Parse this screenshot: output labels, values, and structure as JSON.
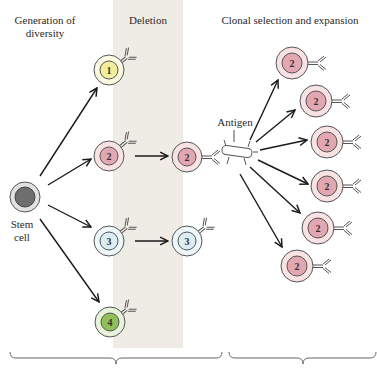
{
  "headings": {
    "generation": "Generation of diversity",
    "generation_line1": "Generation of",
    "generation_line2": "diversity",
    "deletion": "Deletion",
    "clonal": "Clonal selection and expansion"
  },
  "labels": {
    "stem_line1": "Stem",
    "stem_line2": "cell",
    "antigen": "Antigen"
  },
  "cells": {
    "stem": {
      "label": "",
      "nucleus_color": "#6e6e6e",
      "cyto_color": "#e2e2e2"
    },
    "c1": {
      "label": "1",
      "nucleus_color": "#f3ee9c",
      "cyto_color": "#fbf9df"
    },
    "c2": {
      "label": "2",
      "nucleus_color": "#e3a7b1",
      "cyto_color": "#f8e2e4"
    },
    "c3": {
      "label": "3",
      "nucleus_color": "#dbeef6",
      "cyto_color": "#eef7fa"
    },
    "c4": {
      "label": "4",
      "nucleus_color": "#90bf5a",
      "cyto_color": "#e9f3dc"
    },
    "c2_surv": {
      "label": "2"
    },
    "c3_surv": {
      "label": "3"
    },
    "clones": [
      {
        "label": "2"
      },
      {
        "label": "2"
      },
      {
        "label": "2"
      },
      {
        "label": "2"
      },
      {
        "label": "2"
      },
      {
        "label": "2"
      }
    ]
  },
  "colors": {
    "deletion_band": "#efece6",
    "outline": "#555555",
    "arrow": "#1a1a1a"
  }
}
